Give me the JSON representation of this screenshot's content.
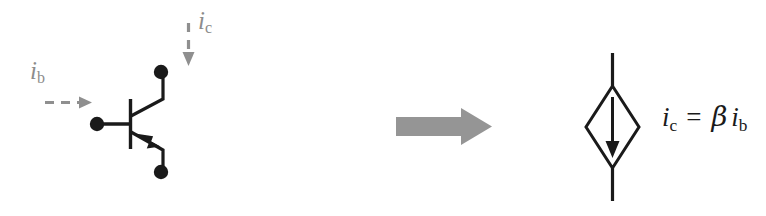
{
  "figure": {
    "background_color": "#ffffff",
    "ink_color": "#1a1a1a",
    "annotation_color": "#8c8c8c",
    "big_arrow_color": "#959595"
  },
  "left_circuit": {
    "name": "bjt-transistor-symbol",
    "device_type": "bipolar-junction-transistor",
    "terminals": [
      {
        "name": "collector-terminal",
        "label": ""
      },
      {
        "name": "base-terminal",
        "label": ""
      },
      {
        "name": "emitter-terminal",
        "label": ""
      }
    ],
    "annotations": [
      {
        "name": "base-current-label",
        "symbol": "i",
        "subscript": "b",
        "arrow": "dashed-right-arrow",
        "color": "#8c8c8c"
      },
      {
        "name": "collector-current-label",
        "symbol": "i",
        "subscript": "c",
        "arrow": "dashed-down-arrow",
        "color": "#8c8c8c"
      }
    ]
  },
  "transform_arrow": {
    "name": "equivalence-arrow",
    "direction": "right",
    "color": "#959595"
  },
  "right_circuit": {
    "name": "dependent-current-source",
    "symbol_shape": "diamond",
    "internal_arrow_direction": "down",
    "equation": {
      "lhs_symbol": "i",
      "lhs_subscript": "c",
      "operator": "=",
      "gain_symbol": "β",
      "rhs_symbol": "i",
      "rhs_subscript": "b",
      "plain_text": "i_c = β i_b"
    }
  }
}
